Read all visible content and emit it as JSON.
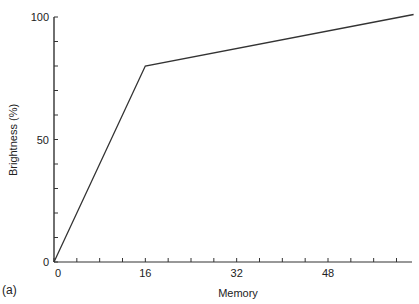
{
  "chart_data": {
    "type": "line",
    "title": "",
    "panel_label": "(a)",
    "xlabel": "Memory",
    "ylabel": "Brightness (%)",
    "xlim": [
      0,
      63
    ],
    "ylim": [
      0,
      100
    ],
    "x_ticks": [
      0,
      16,
      32,
      48
    ],
    "x_tick_labels": [
      "0",
      "16",
      "32",
      "48"
    ],
    "x_minor_tick_step": 4,
    "y_ticks": [
      0,
      50,
      100
    ],
    "y_tick_labels": [
      "0",
      "50",
      "100"
    ],
    "y_minor_tick_step": 10,
    "grid": false,
    "legend": null,
    "series": [
      {
        "name": "Brightness",
        "x": [
          0,
          16,
          63
        ],
        "y": [
          0,
          80,
          101
        ]
      }
    ],
    "line_color": "#333333"
  }
}
